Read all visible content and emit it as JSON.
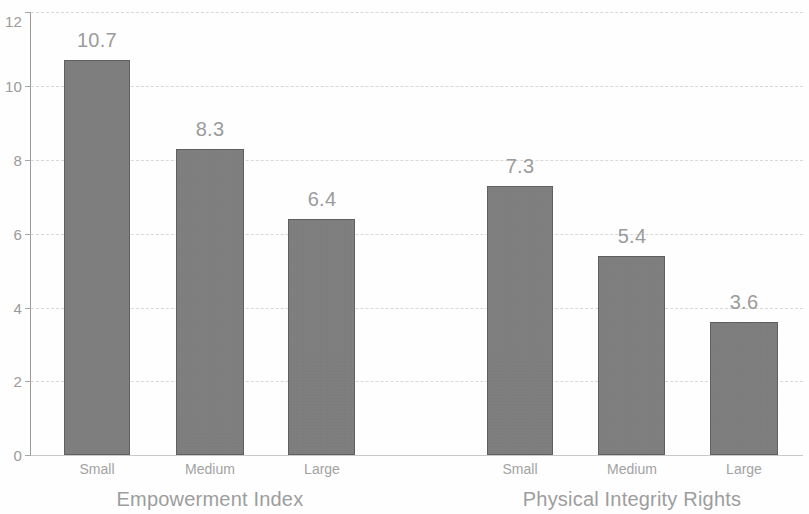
{
  "chart_data": {
    "type": "bar",
    "title": "",
    "xlabel": "",
    "ylabel": "",
    "ylim": [
      0,
      12
    ],
    "yticks": [
      0,
      2,
      4,
      6,
      8,
      10,
      12
    ],
    "ytick_labels": [
      "0",
      "2",
      "4",
      "6",
      "8",
      "10",
      "12"
    ],
    "grid": true,
    "legend": "none",
    "categories": [
      "Small",
      "Medium",
      "Large"
    ],
    "groups": [
      {
        "name": "Empowerment Index",
        "categories": [
          "Small",
          "Medium",
          "Large"
        ],
        "values": [
          10.7,
          8.3,
          6.4
        ],
        "value_labels": [
          "10.7",
          "8.3",
          "6.4"
        ]
      },
      {
        "name": "Physical Integrity Rights",
        "categories": [
          "Small",
          "Medium",
          "Large"
        ],
        "values": [
          7.3,
          5.4,
          3.6
        ],
        "value_labels": [
          "7.3",
          "5.4",
          "3.6"
        ]
      }
    ],
    "colors": {
      "bar_fill": "#7e7e7e",
      "bar_border": "#5f5f5f",
      "gridline": "#d8d8d8",
      "axis": "#9a9a9a",
      "text": "#9b9b9b",
      "background": "#fefefe"
    }
  },
  "bars": [
    {
      "label": "10.7",
      "category": "Small",
      "group": "Empowerment Index",
      "value": 10.7,
      "x": 64,
      "w": 66,
      "label_cx": 97
    },
    {
      "label": "8.3",
      "category": "Medium",
      "group": "Empowerment Index",
      "value": 8.3,
      "x": 176,
      "w": 68,
      "label_cx": 210
    },
    {
      "label": "6.4",
      "category": "Large",
      "group": "Empowerment Index",
      "value": 6.4,
      "x": 288,
      "w": 67,
      "label_cx": 322
    },
    {
      "label": "7.3",
      "category": "Small",
      "group": "Physical Integrity Rights",
      "value": 7.3,
      "x": 487,
      "w": 66,
      "label_cx": 520
    },
    {
      "label": "5.4",
      "category": "Medium",
      "group": "Physical Integrity Rights",
      "value": 5.4,
      "x": 598,
      "w": 67,
      "label_cx": 632
    },
    {
      "label": "3.6",
      "category": "Large",
      "group": "Physical Integrity Rights",
      "value": 3.6,
      "x": 710,
      "w": 68,
      "label_cx": 744
    }
  ],
  "group_titles": [
    {
      "text": "Empowerment Index",
      "cx": 210
    },
    {
      "text": "Physical Integrity Rights",
      "cx": 632
    }
  ]
}
